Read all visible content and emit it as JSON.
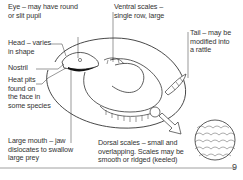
{
  "diagram": {
    "labels": {
      "eye": [
        "Eye – may have round",
        "or slit pupil"
      ],
      "head": [
        "Head – varies",
        "in shape"
      ],
      "nostril": [
        "Nostril"
      ],
      "heat_pits": [
        "Heat pits",
        "found on",
        "the face in",
        "some species"
      ],
      "mouth": [
        "Large mouth –  jaw",
        "dislocates to swallow",
        "large prey"
      ],
      "ventral": [
        "Ventral scales –",
        "single row, large"
      ],
      "tail": [
        "Tail – may be",
        "modified into",
        "a rattle"
      ],
      "dorsal": [
        "Dorsal scales – small and",
        "overlapping. Scales may be",
        "smooth or ridged (keeled)"
      ]
    }
  },
  "page_number": "9"
}
